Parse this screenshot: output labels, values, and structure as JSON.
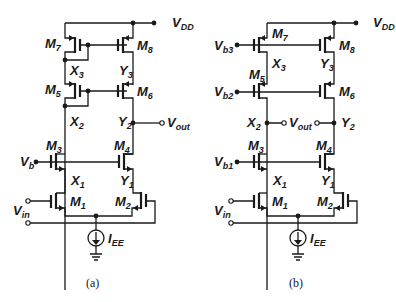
{
  "figure": {
    "panels": [
      {
        "id": "a",
        "caption": "(a)",
        "supply": {
          "main": "V",
          "sub": "DD"
        },
        "transistors": [
          {
            "name": "M",
            "sub": "7"
          },
          {
            "name": "M",
            "sub": "8"
          },
          {
            "name": "M",
            "sub": "5"
          },
          {
            "name": "M",
            "sub": "6"
          },
          {
            "name": "M",
            "sub": "3"
          },
          {
            "name": "M",
            "sub": "4"
          },
          {
            "name": "M",
            "sub": "1"
          },
          {
            "name": "M",
            "sub": "2"
          }
        ],
        "nodes": [
          {
            "name": "X",
            "sub": "3"
          },
          {
            "name": "Y",
            "sub": "3"
          },
          {
            "name": "X",
            "sub": "2"
          },
          {
            "name": "Y",
            "sub": "2"
          },
          {
            "name": "X",
            "sub": "1"
          },
          {
            "name": "Y",
            "sub": "1"
          }
        ],
        "bias": [
          {
            "name": "V",
            "sub": "b"
          }
        ],
        "input": {
          "main": "V",
          "sub": "in"
        },
        "output": {
          "main": "V",
          "sub": "out"
        },
        "current_source": {
          "main": "I",
          "sub": "EE"
        }
      },
      {
        "id": "b",
        "caption": "(b)",
        "supply": {
          "main": "V",
          "sub": "DD"
        },
        "transistors": [
          {
            "name": "M",
            "sub": "7"
          },
          {
            "name": "M",
            "sub": "8"
          },
          {
            "name": "M",
            "sub": "5"
          },
          {
            "name": "M",
            "sub": "6"
          },
          {
            "name": "M",
            "sub": "3"
          },
          {
            "name": "M",
            "sub": "4"
          },
          {
            "name": "M",
            "sub": "1"
          },
          {
            "name": "M",
            "sub": "2"
          }
        ],
        "nodes": [
          {
            "name": "X",
            "sub": "3"
          },
          {
            "name": "Y",
            "sub": "3"
          },
          {
            "name": "X",
            "sub": "2"
          },
          {
            "name": "Y",
            "sub": "2"
          },
          {
            "name": "X",
            "sub": "1"
          },
          {
            "name": "Y",
            "sub": "1"
          }
        ],
        "bias": [
          {
            "name": "V",
            "sub": "b3"
          },
          {
            "name": "V",
            "sub": "b2"
          },
          {
            "name": "V",
            "sub": "b1"
          }
        ],
        "input": {
          "main": "V",
          "sub": "in"
        },
        "output": {
          "main": "V",
          "sub": "out"
        },
        "current_source": {
          "main": "I",
          "sub": "EE"
        }
      }
    ]
  }
}
